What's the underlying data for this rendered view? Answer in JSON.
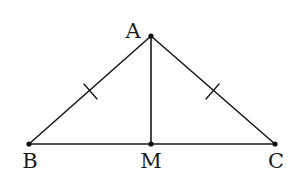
{
  "diagram": {
    "type": "isosceles-triangle-with-median",
    "colors": {
      "stroke": "#1a1a1a",
      "background": "#ffffff"
    },
    "points": {
      "A": {
        "label": "A",
        "x": 151,
        "y": 36,
        "label_x": 133,
        "label_y": 37
      },
      "B": {
        "label": "B",
        "x": 29,
        "y": 144,
        "label_x": 29,
        "label_y": 168
      },
      "M": {
        "label": "M",
        "x": 151,
        "y": 144,
        "label_x": 151,
        "label_y": 168
      },
      "C": {
        "label": "C",
        "x": 275,
        "y": 144,
        "label_x": 276,
        "label_y": 168
      }
    },
    "segments": [
      {
        "from": "A",
        "to": "B",
        "tick_marks": 1
      },
      {
        "from": "A",
        "to": "C",
        "tick_marks": 1
      },
      {
        "from": "B",
        "to": "C",
        "tick_marks": 0
      },
      {
        "from": "A",
        "to": "M",
        "tick_marks": 0
      }
    ]
  }
}
